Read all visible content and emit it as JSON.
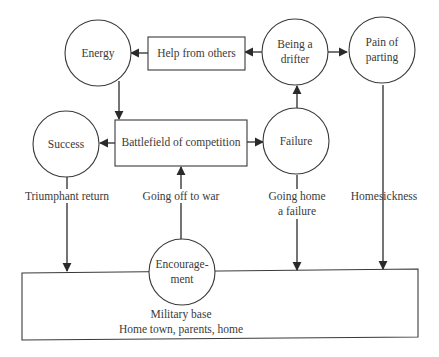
{
  "diagram": {
    "type": "flow-diagram",
    "nodes": {
      "energy": {
        "label_lines": [
          "Energy"
        ],
        "shape": "circle"
      },
      "help": {
        "label_lines": [
          "Help from others"
        ],
        "shape": "rect"
      },
      "drifter": {
        "label_lines": [
          "Being a",
          "drifter"
        ],
        "shape": "circle"
      },
      "pain": {
        "label_lines": [
          "Pain of",
          "parting"
        ],
        "shape": "circle"
      },
      "success": {
        "label_lines": [
          "Success"
        ],
        "shape": "circle"
      },
      "battlefield": {
        "label_lines": [
          "Battlefield of competition"
        ],
        "shape": "rect"
      },
      "failure": {
        "label_lines": [
          "Failure"
        ],
        "shape": "circle"
      },
      "encouragement": {
        "label_lines": [
          "Encourage-",
          "ment"
        ],
        "shape": "circle"
      },
      "home": {
        "label_lines": [
          "Military base",
          "Home town, parents, home"
        ],
        "shape": "rect"
      }
    },
    "edges": [
      {
        "from": "help",
        "to": "energy",
        "label": ""
      },
      {
        "from": "drifter",
        "to": "help",
        "label": ""
      },
      {
        "from": "drifter",
        "to": "pain",
        "label": ""
      },
      {
        "from": "energy",
        "to": "battlefield",
        "label": ""
      },
      {
        "from": "battlefield",
        "to": "success",
        "label": ""
      },
      {
        "from": "battlefield",
        "to": "failure",
        "label": ""
      },
      {
        "from": "failure",
        "to": "drifter",
        "label": ""
      },
      {
        "from": "success",
        "to": "home",
        "label": "Triumphant return"
      },
      {
        "from": "home",
        "to": "battlefield",
        "label": "Going off to war"
      },
      {
        "from": "failure",
        "to": "home",
        "label_lines": [
          "Going home",
          "a failure"
        ]
      },
      {
        "from": "pain",
        "to": "home",
        "label": "Homesickness"
      }
    ],
    "edge_labels": {
      "triumphant": "Triumphant return",
      "off_to_war": "Going off to war",
      "going_home_1": "Going home",
      "going_home_2": "a failure",
      "homesickness": "Homesickness"
    }
  }
}
